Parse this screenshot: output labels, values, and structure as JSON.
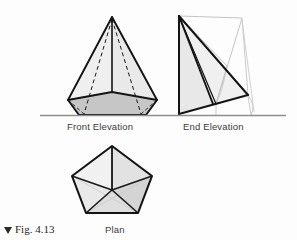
{
  "figure": {
    "caption_marker": "▲",
    "caption_text": "Fig. 4.13"
  },
  "views": {
    "front_elevation": {
      "label": "Front Elevation",
      "description": "pentagonal pyramid seen from the front, apex on top, hidden base edges dashed"
    },
    "end_elevation": {
      "label": "End Elevation",
      "description": "pentagonal pyramid seen from the end, thick outline with light grey construction lines and arcs"
    },
    "plan": {
      "label": "Plan",
      "description": "regular pentagon with edges radiating from the centre to each vertex"
    }
  },
  "colors": {
    "background": "#fdfdfd",
    "outline": "#141414",
    "ground_line": "#8e8e8e",
    "construction_line": "#b9b9b9",
    "fill_light": "#eeeeee",
    "fill_mid": "#e0e0e0",
    "fill_dark": "#c2c2c2",
    "fill_darker": "#b0b0b0",
    "label_text": "#3b3b3b",
    "caption_text": "#1d1d1d"
  },
  "geometry": {
    "ground_line": {
      "x1": 40,
      "y": 115,
      "x2": 286
    },
    "front_elevation": {
      "apex": [
        112,
        17
      ],
      "base_outline": [
        [
          68,
          100
        ],
        [
          79,
          115
        ],
        [
          146,
          115
        ],
        [
          157,
          100
        ],
        [
          112,
          90
        ]
      ],
      "visible_base_front": [
        [
          79,
          115
        ],
        [
          146,
          115
        ],
        [
          157,
          100
        ],
        [
          112,
          92
        ],
        [
          68,
          100
        ]
      ],
      "hidden_edges": [
        [
          [
            112,
            17
          ],
          [
            84,
            115
          ]
        ],
        [
          [
            112,
            17
          ],
          [
            141,
            115
          ]
        ]
      ],
      "centre_edge": [
        [
          112,
          17
        ],
        [
          112,
          92
        ]
      ]
    },
    "end_elevation": {
      "apex": [
        179,
        16
      ],
      "base_left": [
        179,
        114
      ],
      "base_right": [
        248,
        95
      ],
      "mid_point": [
        215,
        102
      ],
      "construction_top_right": [
        242,
        18
      ]
    },
    "plan": {
      "vertices": [
        [
          112,
          146
        ],
        [
          152,
          176
        ],
        [
          138,
          213
        ],
        [
          86,
          213
        ],
        [
          72,
          176
        ]
      ],
      "centre": [
        112,
        190
      ]
    }
  }
}
